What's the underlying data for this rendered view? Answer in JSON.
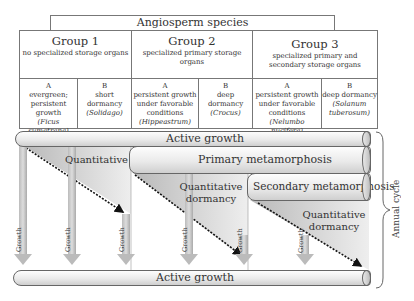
{
  "title": "Angiosperm species",
  "groups": [
    {
      "name": "Group 1",
      "desc": "no specialized storage organs",
      "subs": [
        {
          "letter": "A",
          "text": "evergreen; persistent growth",
          "species": "(Ficus sumatrana)"
        },
        {
          "letter": "B",
          "text": "short dormancy",
          "species": "(Solidago)"
        }
      ]
    },
    {
      "name": "Group 2",
      "desc": "specialized primary storage organs",
      "subs": [
        {
          "letter": "A",
          "text": "persistent growth under favorable conditions",
          "species": "(Hippeastrum)"
        },
        {
          "letter": "B",
          "text": "deep dormancy",
          "species": "(Crocus)"
        }
      ]
    },
    {
      "name": "Group 3",
      "desc": "specialized primary and secondary storage organs",
      "subs": [
        {
          "letter": "A",
          "text": "persistent growth under favorable conditions",
          "species": "(Nelumbo nucifera)"
        },
        {
          "letter": "B",
          "text": "deep dormancy",
          "species": "(Solanum tuberosum)"
        }
      ]
    }
  ],
  "cycle": {
    "active_growth_top": "Active growth",
    "primary_metamorphosis": "Primary metamorphosis",
    "secondary_metamorphosis": "Secondary metamorphosis",
    "quantitative_dormancy": [
      "Quantitative dormancy",
      "Quantitative dormancy",
      "Quantitative dormancy"
    ],
    "growth_label": "Growth",
    "active_growth_bottom": "Active growth",
    "annual_cycle": "Annual cycle"
  }
}
